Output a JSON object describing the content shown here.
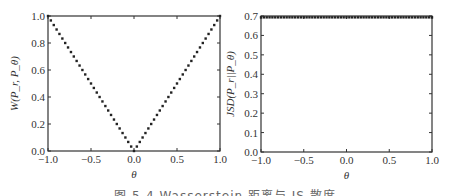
{
  "figure": {
    "caption": "图 5-4  Wasserstein 距离与 JS 散度"
  },
  "chart_data": [
    {
      "type": "scatter",
      "title": "",
      "xlabel": "θ",
      "ylabel": "W(P_r, P_θ)",
      "xlim": [
        -1.0,
        1.0
      ],
      "ylim": [
        0.0,
        1.0
      ],
      "xticks": [
        "-1.0",
        "-0.5",
        "0.0",
        "0.5",
        "1.0"
      ],
      "yticks": [
        "0.0",
        "0.2",
        "0.4",
        "0.6",
        "0.8",
        "1.0"
      ],
      "grid": false,
      "legend": null,
      "series": [
        {
          "name": "W(P_r, P_θ)",
          "marker": "dot",
          "color": "#222222",
          "formula": "y = |θ|",
          "x": [
            -1.0,
            -0.967,
            -0.933,
            -0.9,
            -0.867,
            -0.833,
            -0.8,
            -0.767,
            -0.733,
            -0.7,
            -0.667,
            -0.633,
            -0.6,
            -0.567,
            -0.533,
            -0.5,
            -0.467,
            -0.433,
            -0.4,
            -0.367,
            -0.333,
            -0.3,
            -0.267,
            -0.233,
            -0.2,
            -0.167,
            -0.133,
            -0.1,
            -0.067,
            -0.033,
            0.0,
            0.033,
            0.067,
            0.1,
            0.133,
            0.167,
            0.2,
            0.233,
            0.267,
            0.3,
            0.333,
            0.367,
            0.4,
            0.433,
            0.467,
            0.5,
            0.533,
            0.567,
            0.6,
            0.633,
            0.667,
            0.7,
            0.733,
            0.767,
            0.8,
            0.833,
            0.867,
            0.9,
            0.933,
            0.967,
            1.0
          ],
          "y": [
            1.0,
            0.967,
            0.933,
            0.9,
            0.867,
            0.833,
            0.8,
            0.767,
            0.733,
            0.7,
            0.667,
            0.633,
            0.6,
            0.567,
            0.533,
            0.5,
            0.467,
            0.433,
            0.4,
            0.367,
            0.333,
            0.3,
            0.267,
            0.233,
            0.2,
            0.167,
            0.133,
            0.1,
            0.067,
            0.033,
            0.0,
            0.033,
            0.067,
            0.1,
            0.133,
            0.167,
            0.2,
            0.233,
            0.267,
            0.3,
            0.333,
            0.367,
            0.4,
            0.433,
            0.467,
            0.5,
            0.533,
            0.567,
            0.6,
            0.633,
            0.667,
            0.7,
            0.733,
            0.767,
            0.8,
            0.833,
            0.867,
            0.9,
            0.933,
            0.967,
            1.0
          ]
        }
      ]
    },
    {
      "type": "scatter",
      "title": "",
      "xlabel": "θ",
      "ylabel": "JSD(P_r||P_θ)",
      "xlim": [
        -1.0,
        1.0
      ],
      "ylim": [
        0.0,
        0.7
      ],
      "xticks": [
        "-1.0",
        "-0.5",
        "0.0",
        "0.5",
        "1.0"
      ],
      "yticks": [
        "0.0",
        "0.1",
        "0.2",
        "0.3",
        "0.4",
        "0.5",
        "0.6",
        "0.7"
      ],
      "grid": false,
      "legend": null,
      "series": [
        {
          "name": "JSD(P_r||P_θ)",
          "marker": "dot",
          "color": "#222222",
          "formula": "y = ln 2 ≈ 0.693 for θ ≠ 0",
          "x_range": [
            -1.0,
            1.0
          ],
          "n_points": 61,
          "value": 0.693
        }
      ]
    }
  ]
}
